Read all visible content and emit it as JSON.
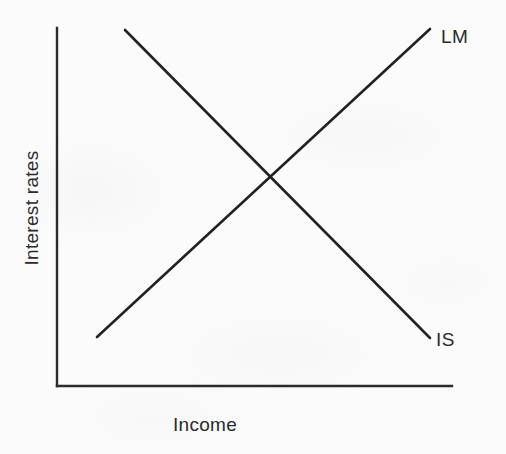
{
  "figure": {
    "type": "economics-diagram",
    "background_color": "#fbfbfb",
    "line_color": "#222222",
    "text_color": "#2a2a2a"
  },
  "axes": {
    "x_label": "Income",
    "y_label": "Interest rates"
  },
  "labels": {
    "lm": "LM",
    "is": "IS"
  },
  "chart_data": {
    "type": "line",
    "title": "",
    "subtitle": "",
    "xlabel": "Income",
    "ylabel": "Interest rates",
    "xlim": [
      0,
      100
    ],
    "ylim": [
      0,
      100
    ],
    "grid": false,
    "legend": "inline-end-labels",
    "axis_ticks": {
      "x": [],
      "y": []
    },
    "series": [
      {
        "name": "IS",
        "label": "IS",
        "slope": "negative",
        "description": "Downward-sloping IS curve: investment-saving equilibrium in the goods market",
        "x": [
          17,
          94
        ],
        "y": [
          99,
          13
        ],
        "color": "#222222"
      },
      {
        "name": "LM",
        "label": "LM",
        "slope": "positive",
        "description": "Upward-sloping LM curve: liquidity-money equilibrium in the money market",
        "x": [
          10,
          94
        ],
        "y": [
          14,
          100
        ],
        "color": "#222222"
      }
    ],
    "annotations": [
      {
        "name": "equilibrium",
        "x": 54,
        "y": 57,
        "label": "",
        "description": "Intersection of IS and LM curves marking general equilibrium"
      }
    ]
  },
  "geometry": {
    "y_axis": {
      "x1": 57,
      "y1": 28,
      "x2": 57,
      "y2": 386
    },
    "x_axis": {
      "x1": 57,
      "y1": 386,
      "x2": 452,
      "y2": 386
    },
    "is_curve": {
      "x1": 125,
      "y1": 30,
      "x2": 430,
      "y2": 338
    },
    "lm_curve": {
      "x1": 97,
      "y1": 337,
      "x2": 430,
      "y2": 29
    },
    "intersection": {
      "x": 270,
      "y": 182
    }
  }
}
